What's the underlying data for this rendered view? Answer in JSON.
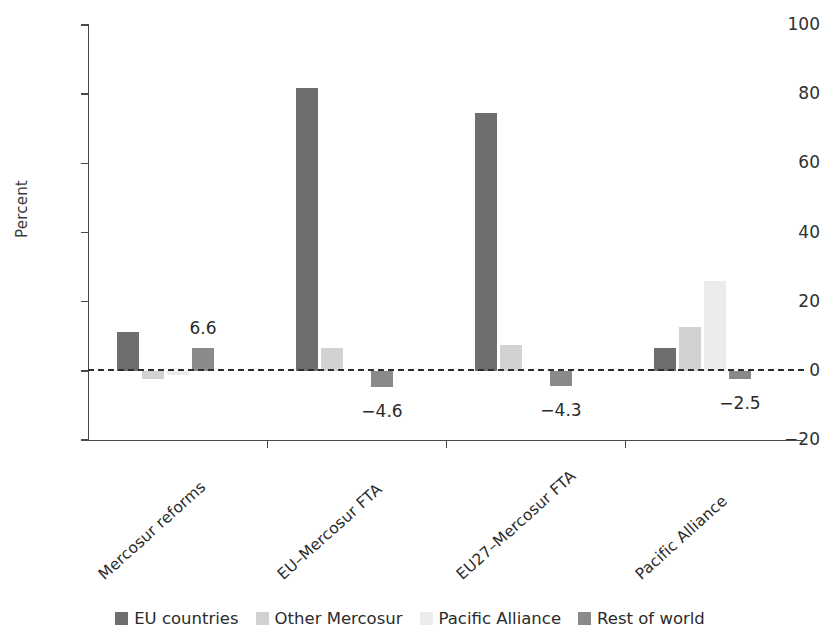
{
  "chart_data": {
    "type": "bar",
    "title": "",
    "xlabel": "",
    "ylabel": "Percent",
    "ylim": [
      -20,
      100
    ],
    "yticks": [
      -20,
      0,
      20,
      40,
      60,
      80,
      100
    ],
    "ytick_labels": [
      "−20",
      "0",
      "20",
      "40",
      "60",
      "80",
      "100"
    ],
    "grid": false,
    "zero_reference_line": true,
    "legend_position": "bottom",
    "categories": [
      "Mercosur reforms",
      "EU–Mercosur FTA",
      "EU27–Mercosur FTA",
      "Pacific Alliance"
    ],
    "series": [
      {
        "name": "EU countries",
        "color": "#6e6e6e",
        "values": [
          11.2,
          81.8,
          74.5,
          6.6
        ]
      },
      {
        "name": "Other Mercosur",
        "color": "#d2d2d2",
        "values": [
          -2.5,
          6.5,
          7.6,
          12.6
        ]
      },
      {
        "name": "Pacific Alliance",
        "color": "#ececec",
        "values": [
          -1.2,
          0.0,
          0.0,
          26.0
        ]
      },
      {
        "name": "Rest of world",
        "color": "#8a8a8a",
        "values": [
          6.6,
          -4.6,
          -4.3,
          -2.5
        ]
      }
    ],
    "annotations": [
      {
        "text": "6.6",
        "category": "Mercosur reforms",
        "series": "Rest of world"
      },
      {
        "text": "−4.6",
        "category": "EU–Mercosur FTA",
        "series": "Rest of world"
      },
      {
        "text": "−4.3",
        "category": "EU27–Mercosur FTA",
        "series": "Rest of world"
      },
      {
        "text": "−2.5",
        "category": "Pacific Alliance",
        "series": "Rest of world"
      }
    ]
  }
}
